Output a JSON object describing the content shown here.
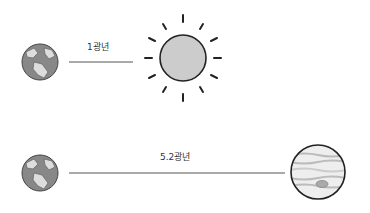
{
  "rows": [
    {
      "from": "earth",
      "to": "sun",
      "distance_label": "1광년"
    },
    {
      "from": "earth",
      "to": "jupiter",
      "distance_label": "5.2광년"
    }
  ],
  "colors": {
    "line": "#555555",
    "planet_fill": "#888888",
    "sun_fill": "#cccccc",
    "outline": "#222222"
  }
}
